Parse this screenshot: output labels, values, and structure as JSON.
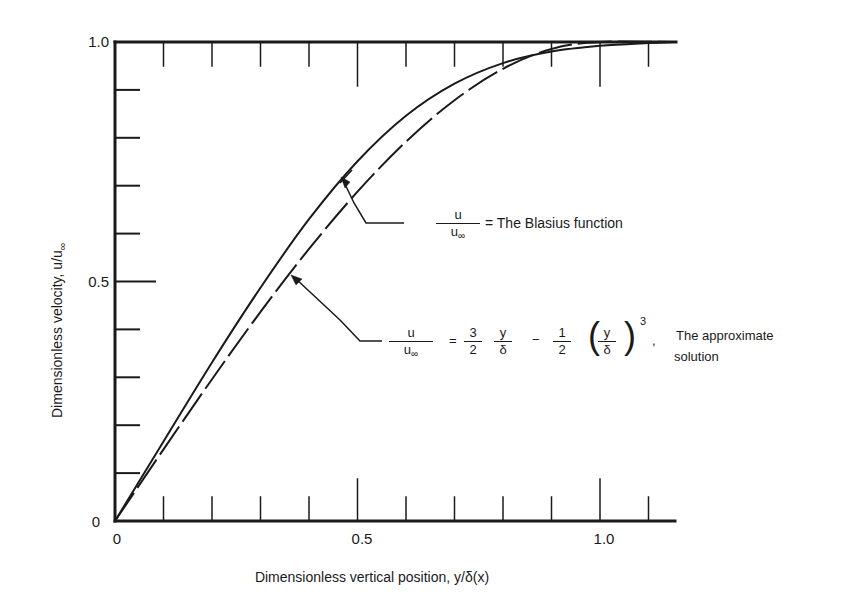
{
  "chart_data": {
    "type": "line",
    "title": "",
    "xlabel": "Dimensionless vertical position, y/δ(x)",
    "ylabel": "Dimensionless velocity, u/u∞",
    "xlim": [
      0,
      1.15
    ],
    "ylim": [
      0,
      1.0
    ],
    "x_tick_labels": [
      "0",
      "0.5",
      "1.0"
    ],
    "x_tick_values": [
      0,
      0.5,
      1.0
    ],
    "x_minor_step": 0.1,
    "y_tick_labels": [
      "0",
      "0.5",
      "1.0"
    ],
    "y_tick_values": [
      0,
      0.5,
      1.0
    ],
    "y_minor_step": 0.1,
    "grid": false,
    "legend": "inline annotations with arrows",
    "series": [
      {
        "name": "The Blasius function",
        "style": "solid",
        "x": [
          0,
          0.1,
          0.2,
          0.3,
          0.4,
          0.5,
          0.6,
          0.7,
          0.8,
          0.9,
          1.0,
          1.1,
          1.15
        ],
        "y": [
          0,
          0.166,
          0.331,
          0.487,
          0.63,
          0.751,
          0.846,
          0.913,
          0.956,
          0.98,
          0.992,
          0.998,
          1.0
        ]
      },
      {
        "name": "The approximate solution: u/u∞ = (3/2)(y/δ) − (1/2)(y/δ)^3",
        "style": "dashed",
        "x": [
          0,
          0.1,
          0.2,
          0.3,
          0.4,
          0.5,
          0.6,
          0.7,
          0.8,
          0.9,
          1.0,
          1.15
        ],
        "y": [
          0,
          0.1495,
          0.296,
          0.4365,
          0.568,
          0.6875,
          0.792,
          0.8785,
          0.944,
          0.9855,
          1.0,
          1.0
        ]
      }
    ],
    "annotations": [
      {
        "label": "u/u∞ = The Blasius function",
        "points_to": "Blasius curve near x≈0.48, y≈0.74"
      },
      {
        "label": "u/u∞ = 3/2 · y/δ − 1/2 · (y/δ)^3 , The approximate solution",
        "points_to": "approximate curve near x≈0.36, y≈0.51"
      }
    ]
  },
  "labels": {
    "y_axis": "Dimensionless velocity, u/u",
    "y_axis_sub": "∞",
    "x_axis": "Dimensionless vertical position, y/δ(x)",
    "y_tick_0": "0",
    "y_tick_05": "0.5",
    "y_tick_10": "1.0",
    "x_tick_0": "0",
    "x_tick_05": "0.5",
    "x_tick_10": "1.0",
    "frac_num": "u",
    "frac_den": "u",
    "frac_den_sub": "∞",
    "blasius_text": "= The Blasius function",
    "eq_equals": "=",
    "eq_3": "3",
    "eq_2a": "2",
    "eq_y1": "y",
    "eq_d1": "δ",
    "eq_minus": "−",
    "eq_1": "1",
    "eq_2b": "2",
    "eq_y2": "y",
    "eq_d2": "δ",
    "eq_pow": "3",
    "eq_comma": ",",
    "approx_text_1": "The approximate",
    "approx_text_2": "solution"
  }
}
